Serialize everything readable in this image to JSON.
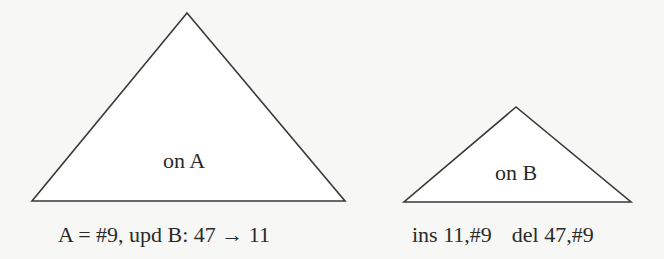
{
  "diagram": {
    "colors": {
      "background": "#f7f7f5",
      "stroke": "#3a3a3a",
      "fill": "#ffffff",
      "text": "#2a2a2a"
    },
    "triangles": [
      {
        "id": "A",
        "label": "on A",
        "caption": "A = #9, upd B: 47 → 11",
        "vertices": [
          [
            187,
            13
          ],
          [
            32,
            201
          ],
          [
            345,
            201
          ]
        ]
      },
      {
        "id": "B",
        "label": "on B",
        "caption_parts": [
          "ins 11,#9",
          "del 47,#9"
        ],
        "vertices": [
          [
            516,
            107
          ],
          [
            404,
            202
          ],
          [
            631,
            202
          ]
        ]
      }
    ]
  }
}
